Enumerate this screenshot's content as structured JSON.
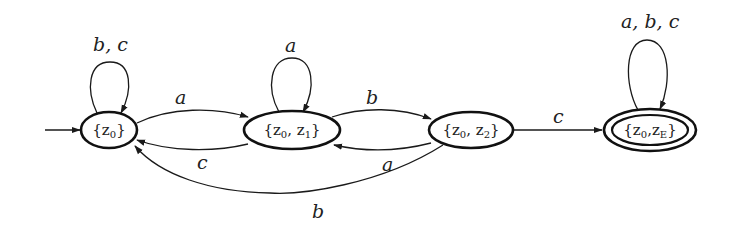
{
  "diagram": {
    "type": "deterministic finite automaton (subset construction)",
    "alphabet": [
      "a",
      "b",
      "c"
    ],
    "start_state": "z0",
    "nodes": [
      {
        "id": "z0",
        "label_base": "{z",
        "sub1": "0",
        "label_end": "}",
        "accepting": false,
        "cx": 109,
        "cy": 130,
        "rx": 28,
        "ry": 18
      },
      {
        "id": "z0z1",
        "label": "{z0, z1}",
        "accepting": false,
        "cx": 292,
        "cy": 130,
        "rx": 48,
        "ry": 19
      },
      {
        "id": "z0z2",
        "label": "{z0, z2}",
        "accepting": false,
        "cx": 471,
        "cy": 130,
        "rx": 42,
        "ry": 18
      },
      {
        "id": "z0zE",
        "label": "{z0, zE}",
        "accepting": true,
        "cx": 650,
        "cy": 130,
        "rx": 46,
        "ry": 20
      }
    ],
    "edges": [
      {
        "from": "start",
        "to": "z0",
        "label": ""
      },
      {
        "from": "z0",
        "to": "z0",
        "label": "b, c"
      },
      {
        "from": "z0",
        "to": "z0z1",
        "label": "a"
      },
      {
        "from": "z0z1",
        "to": "z0",
        "label": "c"
      },
      {
        "from": "z0z1",
        "to": "z0z1",
        "label": "a"
      },
      {
        "from": "z0z1",
        "to": "z0z2",
        "label": "b"
      },
      {
        "from": "z0z2",
        "to": "z0z1",
        "label": "a"
      },
      {
        "from": "z0z2",
        "to": "z0",
        "label": "b"
      },
      {
        "from": "z0z2",
        "to": "z0zE",
        "label": "c"
      },
      {
        "from": "z0zE",
        "to": "z0zE",
        "label": "a, b, c"
      }
    ],
    "labels": {
      "loop_z0": "b, c",
      "z0_to_z0z1": "a",
      "z0z1_to_z0": "c",
      "loop_z0z1": "a",
      "z0z1_to_z0z2": "b",
      "z0z2_to_z0z1": "a",
      "z0z2_to_z0": "b",
      "z0z2_to_z0zE": "c",
      "loop_z0zE": "a, b, c"
    },
    "node_text": {
      "z0": {
        "open": "{z",
        "s1": "0",
        "close": "}"
      },
      "z0z1": {
        "open": "{z",
        "s1": "0",
        "mid": ", z",
        "s2": "1",
        "close": "}"
      },
      "z0z2": {
        "open": "{z",
        "s1": "0",
        "mid": ", z",
        "s2": "2",
        "close": "}"
      },
      "z0zE": {
        "open": "{z",
        "s1": "0",
        "mid": ",z",
        "s2": "E",
        "close": "}"
      }
    },
    "colors": {
      "stroke": "#111111",
      "text": "#222222",
      "background": "#ffffff"
    }
  }
}
